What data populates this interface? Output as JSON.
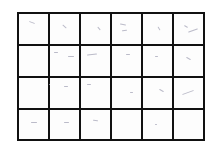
{
  "grid": {
    "rows": 4,
    "columns": 6,
    "line_color": "#111111",
    "cell_color": "#fdfdfd",
    "mark_color": "#aaaabb",
    "cells": [
      [
        {
          "marks": [
            [
              10,
              8,
              6,
              20
            ]
          ]
        },
        {
          "marks": [
            [
              12,
              12,
              5,
              40
            ]
          ]
        },
        {
          "marks": [
            [
              16,
              14,
              4,
              50
            ]
          ]
        },
        {
          "marks": [
            [
              8,
              10,
              6,
              10
            ],
            [
              10,
              16,
              5,
              -10
            ]
          ]
        },
        {
          "marks": [
            [
              14,
              14,
              4,
              60
            ]
          ]
        },
        {
          "marks": [
            [
              10,
              12,
              4,
              30
            ],
            [
              14,
              16,
              10,
              -20
            ]
          ]
        }
      ],
      [
        {
          "marks": []
        },
        {
          "marks": [
            [
              4,
              6,
              4,
              0
            ],
            [
              18,
              10,
              6,
              0
            ]
          ]
        },
        {
          "marks": [
            [
              6,
              8,
              10,
              -5
            ]
          ]
        },
        {
          "marks": [
            [
              14,
              8,
              4,
              0
            ]
          ]
        },
        {
          "marks": [
            [
              12,
              10,
              3,
              0
            ]
          ]
        },
        {
          "marks": [
            [
              12,
              12,
              5,
              30
            ]
          ]
        }
      ],
      [
        {
          "marks": [
            [
              30,
              6,
              2,
              0
            ]
          ]
        },
        {
          "marks": [
            [
              14,
              8,
              4,
              0
            ]
          ]
        },
        {
          "marks": [
            [
              6,
              6,
              4,
              0
            ]
          ]
        },
        {
          "marks": [
            [
              18,
              14,
              3,
              0
            ]
          ]
        },
        {
          "marks": [
            [
              16,
              12,
              5,
              30
            ]
          ]
        },
        {
          "marks": [
            [
              8,
              14,
              12,
              -20
            ]
          ]
        }
      ],
      [
        {
          "marks": [
            [
              12,
              12,
              6,
              0
            ]
          ]
        },
        {
          "marks": [
            [
              14,
              12,
              5,
              0
            ]
          ]
        },
        {
          "marks": [
            [
              12,
              10,
              5,
              10
            ]
          ]
        },
        {
          "marks": []
        },
        {
          "marks": [
            [
              12,
              14,
              2,
              0
            ]
          ]
        },
        {
          "marks": []
        }
      ]
    ]
  }
}
